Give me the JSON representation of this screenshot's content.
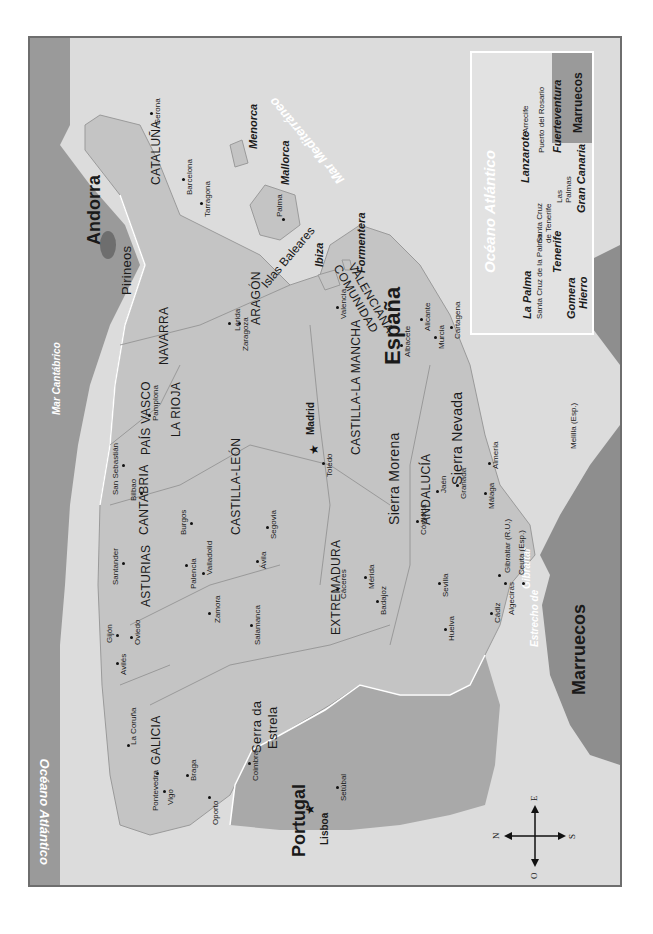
{
  "map": {
    "title": "España",
    "orientation": "rotated 90° counter-clockwise; north points left",
    "countries": {
      "spain": "España",
      "portugal": "Portugal",
      "andorra": "Andorra",
      "morocco": "Marruecos"
    },
    "seas": {
      "atlantic": "Océano Atlántico",
      "cantabrian": "Mar Cantábrico",
      "mediterranean": "Mar Mediterráneo",
      "strait_1": "Estrecho de",
      "strait_2": "Gibraltar"
    },
    "regions": {
      "galicia": "GALICIA",
      "asturias": "ASTURIAS",
      "cantabria": "CANTABRIA",
      "pais_vasco": "PAÍS VASCO",
      "navarra": "NAVARRA",
      "la_rioja": "LA RIOJA",
      "aragon": "ARAGÓN",
      "cataluna": "CATALUÑA",
      "castilla_leon": "CASTILLA-LEÓN",
      "castilla_la_mancha": "CASTILLA-LA MANCHA",
      "extremadura": "EXTREMADURA",
      "andalucia": "ANDALUCÍA",
      "valenciana_1": "COMUNIDAD",
      "valenciana_2": "VALENCIANA"
    },
    "mountains": {
      "pirineos": "Pirineos",
      "sierra_morena": "Sierra Morena",
      "sierra_nevada": "Sierra Nevada",
      "serra_estrela_1": "Serra da",
      "serra_estrela_2": "Estrela"
    },
    "capitals": {
      "madrid": "Madrid",
      "lisboa": "Lisboa"
    },
    "cities": {
      "la_coruna": "La Coruña",
      "aviles": "Avilés",
      "gijon": "Gijón",
      "oviedo": "Oviedo",
      "santander": "Santander",
      "bilbao": "Bilbao",
      "san_sebastian": "San Sebastián",
      "pamplona": "Pamplona",
      "pontevedra": "Pontevedra",
      "vigo": "Vigo",
      "burgos": "Burgos",
      "palencia": "Palencia",
      "valladolid": "Valladolid",
      "zamora": "Zamora",
      "salamanca": "Salamanca",
      "avila": "Ávila",
      "segovia": "Segovia",
      "lerida": "Lérida",
      "zaragoza": "Zaragoza",
      "gerona": "Gerona",
      "barcelona": "Barcelona",
      "tarragona": "Tarragona",
      "valencia": "Valencia",
      "albacete": "Albacete",
      "alicante": "Alicante",
      "murcia": "Murcia",
      "cartagena": "Cartagena",
      "toledo": "Toledo",
      "caceres": "Cáceres",
      "merida": "Mérida",
      "badajoz": "Badajoz",
      "cordoba": "Córdoba",
      "jaen": "Jaén",
      "granada": "Granada",
      "almeria": "Almería",
      "malaga": "Málaga",
      "sevilla": "Sevilla",
      "huelva": "Huelva",
      "cadiz": "Cádiz",
      "algeciras": "Algeciras",
      "gibraltar": "Gibraltar (R.U.)",
      "ceuta": "Ceuta (Esp.)",
      "melilla": "Melilla (Esp.)",
      "braga": "Braga",
      "oporto": "Oporto",
      "coimbra": "Coimbra",
      "setubal": "Setúbal",
      "palma": "Palma"
    },
    "balearics": {
      "group": "Islas Baleares",
      "mallorca": "Mallorca",
      "menorca": "Menorca",
      "ibiza": "Ibiza",
      "formentera": "Formentera"
    },
    "canary_inset": {
      "ocean": "Océano Atlántico",
      "morocco": "Marruecos",
      "islands": {
        "la_palma": "La Palma",
        "tenerife": "Tenerife",
        "gomera": "Gomera",
        "hierro": "Hierro",
        "gran_canaria": "Gran Canaria",
        "lanzarote": "Lanzarote",
        "fuerteventura": "Fuerteventura"
      },
      "cities": {
        "santa_cruz_palma": "Santa Cruz de la Palma",
        "santa_cruz_tenerife_1": "Santa Cruz",
        "santa_cruz_tenerife_2": "de Tenerife",
        "las_palmas_1": "Las",
        "las_palmas_2": "Palmas",
        "arrecife": "Arrecife",
        "puerto_rosario": "Puerto del Rosario"
      }
    },
    "compass": {
      "north": "N",
      "south": "S",
      "east": "E",
      "west": "O"
    },
    "colors": {
      "sea": "#dcdcdc",
      "spain": "#c4c4c4",
      "portugal": "#a9a9a9",
      "france": "#9a9a9a",
      "africa": "#8e8e8e",
      "frame": "#6e6e6e",
      "border_line": "#ffffff"
    }
  }
}
